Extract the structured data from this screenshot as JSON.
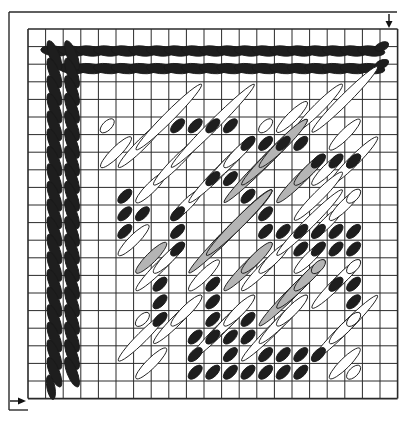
{
  "colors": {
    "background": "#ffffff",
    "grid_line": "#2a2a2a",
    "black_stitch": "#1e1e1e",
    "grey_stitch": "#b4b4b4",
    "white_stitch": "#ffffff",
    "stitch_outline": "#1a1a1a"
  },
  "grid": {
    "cols": 21,
    "rows": 21,
    "left": 28,
    "top": 29,
    "cell": 17.6
  },
  "frame": {
    "left_x": 9,
    "top_y": 12,
    "right_x": 397,
    "bottom_y": 410
  },
  "arrows": [
    {
      "name": "start-arrow-top-right",
      "direction": "down",
      "x": 389,
      "y1": 14,
      "y2": 29
    },
    {
      "name": "start-arrow-bottom-left",
      "direction": "right",
      "y": 401,
      "x1": 10,
      "x2": 28
    }
  ],
  "border_stitches": {
    "slant": "down-right",
    "length_cells": 2,
    "top_row_count": 20,
    "left_col_count": 20
  },
  "interior_stitches": {
    "slant": "up-right",
    "white": [
      [
        4,
        5,
        1
      ],
      [
        4,
        7,
        2
      ],
      [
        5,
        7,
        3
      ],
      [
        6,
        6,
        4
      ],
      [
        6,
        9,
        2
      ],
      [
        7,
        8,
        3
      ],
      [
        8,
        7,
        5
      ],
      [
        8,
        10,
        2
      ],
      [
        9,
        9,
        4
      ],
      [
        10,
        8,
        3
      ],
      [
        11,
        7,
        2
      ],
      [
        13,
        5,
        1
      ],
      [
        14,
        5,
        2
      ],
      [
        15,
        5,
        3
      ],
      [
        16,
        5,
        4
      ],
      [
        17,
        6,
        2
      ],
      [
        17,
        8,
        3
      ],
      [
        18,
        7,
        1
      ],
      [
        16,
        8,
        2
      ],
      [
        15,
        10,
        3
      ],
      [
        16,
        11,
        2
      ],
      [
        17,
        10,
        2
      ],
      [
        18,
        9,
        1
      ],
      [
        5,
        12,
        2
      ],
      [
        6,
        14,
        3
      ],
      [
        7,
        13,
        2
      ],
      [
        6,
        16,
        1
      ],
      [
        7,
        17,
        3
      ],
      [
        8,
        16,
        2
      ],
      [
        9,
        18,
        4
      ],
      [
        10,
        17,
        3
      ],
      [
        11,
        16,
        2
      ],
      [
        12,
        18,
        4
      ],
      [
        13,
        17,
        3
      ],
      [
        14,
        16,
        2
      ],
      [
        12,
        14,
        3
      ],
      [
        13,
        13,
        2
      ],
      [
        14,
        12,
        4
      ],
      [
        15,
        13,
        2
      ],
      [
        16,
        15,
        3
      ],
      [
        17,
        14,
        2
      ],
      [
        18,
        13,
        1
      ],
      [
        16,
        18,
        4
      ],
      [
        17,
        17,
        2
      ],
      [
        18,
        16,
        1
      ],
      [
        10,
        12,
        2
      ],
      [
        11,
        11,
        3
      ],
      [
        9,
        14,
        2
      ],
      [
        5,
        18,
        3
      ],
      [
        6,
        19,
        2
      ],
      [
        18,
        19,
        1
      ],
      [
        17,
        19,
        2
      ]
    ],
    "grey": [
      [
        11,
        9,
        5
      ],
      [
        12,
        8,
        4
      ],
      [
        13,
        7,
        3
      ],
      [
        14,
        9,
        3
      ],
      [
        15,
        8,
        2
      ],
      [
        9,
        13,
        5
      ],
      [
        10,
        12,
        4
      ],
      [
        11,
        14,
        3
      ],
      [
        12,
        13,
        2
      ],
      [
        13,
        16,
        4
      ],
      [
        14,
        15,
        3
      ],
      [
        15,
        14,
        2
      ],
      [
        16,
        13,
        1
      ],
      [
        6,
        13,
        2
      ]
    ],
    "black": [
      [
        8,
        5,
        1
      ],
      [
        9,
        5,
        1
      ],
      [
        10,
        5,
        1
      ],
      [
        11,
        5,
        1
      ],
      [
        5,
        9,
        1
      ],
      [
        5,
        10,
        1
      ],
      [
        5,
        11,
        1
      ],
      [
        6,
        10,
        1
      ],
      [
        12,
        6,
        1
      ],
      [
        13,
        6,
        1
      ],
      [
        14,
        6,
        1
      ],
      [
        15,
        6,
        1
      ],
      [
        16,
        7,
        1
      ],
      [
        17,
        7,
        1
      ],
      [
        18,
        7,
        1
      ],
      [
        10,
        8,
        1
      ],
      [
        11,
        8,
        1
      ],
      [
        12,
        9,
        1
      ],
      [
        13,
        10,
        1
      ],
      [
        8,
        10,
        1
      ],
      [
        8,
        11,
        1
      ],
      [
        8,
        12,
        1
      ],
      [
        7,
        14,
        1
      ],
      [
        7,
        15,
        1
      ],
      [
        7,
        16,
        1
      ],
      [
        13,
        11,
        1
      ],
      [
        14,
        11,
        1
      ],
      [
        15,
        11,
        1
      ],
      [
        16,
        11,
        1
      ],
      [
        17,
        11,
        1
      ],
      [
        18,
        11,
        1
      ],
      [
        15,
        12,
        1
      ],
      [
        16,
        12,
        1
      ],
      [
        17,
        12,
        1
      ],
      [
        18,
        12,
        1
      ],
      [
        17,
        14,
        1
      ],
      [
        18,
        14,
        1
      ],
      [
        18,
        15,
        1
      ],
      [
        10,
        14,
        1
      ],
      [
        10,
        15,
        1
      ],
      [
        10,
        16,
        1
      ],
      [
        10,
        17,
        1
      ],
      [
        11,
        18,
        1
      ],
      [
        12,
        16,
        1
      ],
      [
        12,
        17,
        1
      ],
      [
        12,
        19,
        1
      ],
      [
        9,
        18,
        1
      ],
      [
        9,
        19,
        1
      ],
      [
        11,
        19,
        1
      ],
      [
        13,
        19,
        1
      ],
      [
        14,
        18,
        1
      ],
      [
        15,
        19,
        1
      ],
      [
        16,
        18,
        1
      ],
      [
        10,
        19,
        1
      ],
      [
        9,
        17,
        1
      ],
      [
        11,
        17,
        1
      ],
      [
        13,
        18,
        1
      ],
      [
        15,
        18,
        1
      ],
      [
        14,
        19,
        1
      ]
    ]
  },
  "legend": [
    {
      "label": "black",
      "meaning": "dark yarn"
    },
    {
      "label": "grey",
      "meaning": "medium yarn"
    },
    {
      "label": "white",
      "meaning": "light yarn"
    }
  ]
}
